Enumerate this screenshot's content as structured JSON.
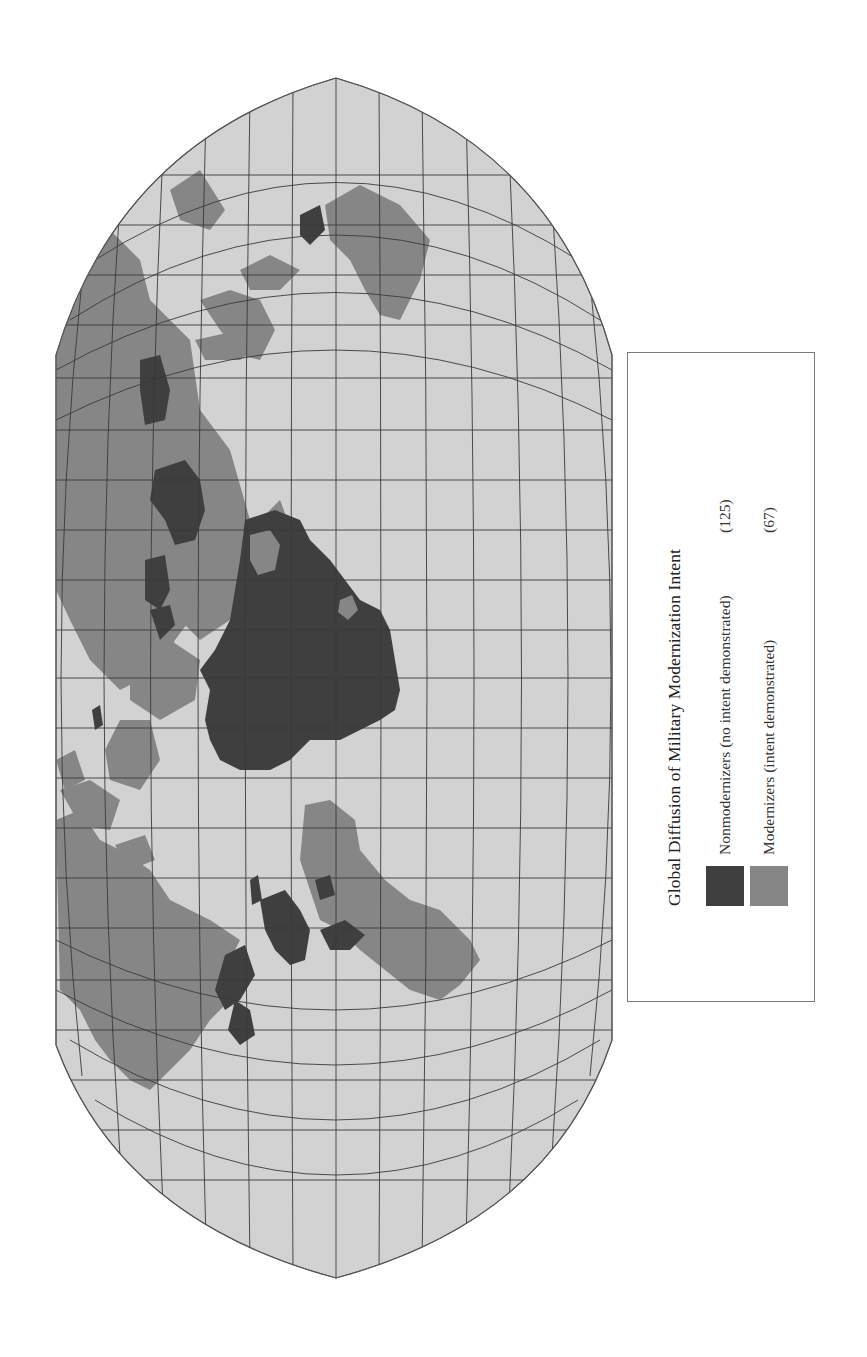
{
  "map": {
    "title": "Global Diffusion of Military Modernization Intent",
    "projection": "pseudocylindrical world map, rotated 90° counter-clockwise",
    "colors": {
      "ocean": "#d2d2d2",
      "graticule": "#3a3a3a",
      "nonmodernizers": "#3f3f3f",
      "modernizers": "#868686",
      "border": "#666666"
    }
  },
  "legend": {
    "title": "Global Diffusion of Military Modernization Intent",
    "items": [
      {
        "label": "Nonmodernizers (no intent demonstrated)",
        "count": "(125)",
        "color": "#3f3f3f"
      },
      {
        "label": "Modernizers (intent demonstrated)",
        "count": "(67)",
        "color": "#868686"
      }
    ]
  }
}
